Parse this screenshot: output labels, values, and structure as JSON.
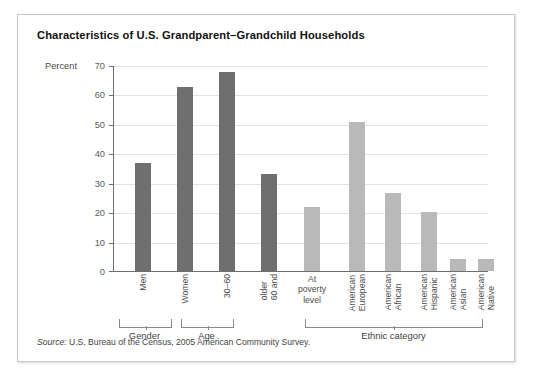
{
  "figure": {
    "title": "Characteristics of U.S. Grandparent–Grandchild Households",
    "source_prefix": "Source:",
    "source_text": "U.S. Bureau of the Census, 2005 American Community Survey."
  },
  "chart_data": {
    "type": "bar",
    "title": "Characteristics of U.S. Grandparent–Grandchild Households",
    "xlabel": "",
    "ylabel": "Percent",
    "ylim": [
      0,
      70
    ],
    "yticks": [
      0,
      10,
      20,
      30,
      40,
      50,
      60,
      70
    ],
    "grid": true,
    "legend": "none",
    "categories": [
      "Men",
      "Women",
      "30–60",
      "60 and older",
      "At poverty level",
      "European American",
      "African American",
      "Hispanic American",
      "Asian American",
      "Native American"
    ],
    "values": [
      37,
      63,
      68,
      33,
      22,
      51,
      26.5,
      20,
      4,
      4
    ],
    "bar_colors": [
      "#706f6f",
      "#706f6f",
      "#706f6f",
      "#706f6f",
      "#b9b9b9",
      "#b9b9b9",
      "#b9b9b9",
      "#b9b9b9",
      "#b9b9b9",
      "#b9b9b9"
    ],
    "groups": [
      {
        "label": "Gender",
        "members": [
          "Men",
          "Women"
        ]
      },
      {
        "label": "Age",
        "members": [
          "30–60",
          "60 and older"
        ]
      },
      {
        "label": "Ethnic category",
        "members": [
          "European American",
          "African American",
          "Hispanic American",
          "Asian American",
          "Native American"
        ]
      }
    ]
  },
  "tick_labels": [
    "70",
    "60",
    "50",
    "40",
    "30",
    "20",
    "10",
    "0"
  ],
  "category_labels": [
    {
      "lines": [
        "Men"
      ],
      "orient": "vertical"
    },
    {
      "lines": [
        "Women"
      ],
      "orient": "vertical"
    },
    {
      "lines": [
        "30–60"
      ],
      "orient": "vertical"
    },
    {
      "lines": [
        "60 and",
        "older"
      ],
      "orient": "vertical"
    },
    {
      "lines": [
        "At",
        "poverty",
        "level"
      ],
      "orient": "horizontal"
    },
    {
      "lines": [
        "European",
        "American"
      ],
      "orient": "vertical"
    },
    {
      "lines": [
        "African",
        "American"
      ],
      "orient": "vertical"
    },
    {
      "lines": [
        "Hispanic",
        "American"
      ],
      "orient": "vertical"
    },
    {
      "lines": [
        "Asian",
        "American"
      ],
      "orient": "vertical"
    },
    {
      "lines": [
        "Native",
        "American"
      ],
      "orient": "vertical"
    }
  ],
  "group_labels": [
    "Gender",
    "Age",
    "Ethnic category"
  ]
}
